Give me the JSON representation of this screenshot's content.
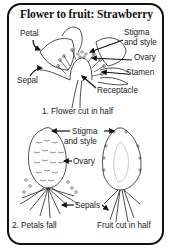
{
  "title": "Flower to fruit: Strawberry",
  "top_panel": {
    "caption": "1. Flower cut in half",
    "labels": {
      "petal": "Petal",
      "stigma_style_line1": "Stigma",
      "stigma_style_line2": "and style",
      "ovary": "Ovary",
      "stamen": "Stamen",
      "sepal": "Sepal",
      "receptacle": "Receptacle"
    }
  },
  "bottom_panel": {
    "left_caption": "2. Petals fall",
    "right_caption": "Fruit cut in half",
    "labels": {
      "stigma_style_line1": "Stigma",
      "stigma_style_line2": "and style",
      "ovary": "Ovary",
      "sepals": "Sepals"
    }
  },
  "colors": {
    "border": "#111111",
    "ink": "#222222",
    "background": "#ffffff"
  }
}
